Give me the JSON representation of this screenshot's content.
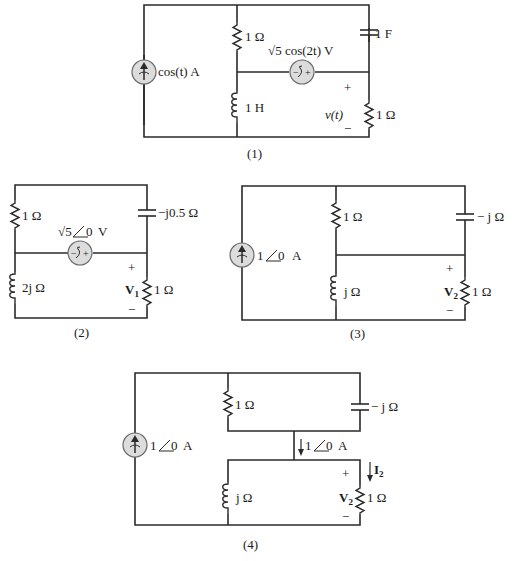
{
  "figure": {
    "circuits": [
      {
        "id": 1,
        "caption": "(1)",
        "current_source": "cos(t) A",
        "resistor_top": "1 Ω",
        "voltage_source": "√5 cos(2t) V",
        "capacitor": "1 F",
        "inductor": "1 H",
        "output_voltage": "v(t)",
        "resistor_load": "1 Ω",
        "plus": "+",
        "minus": "−"
      },
      {
        "id": 2,
        "caption": "(2)",
        "resistor_top": "1 Ω",
        "voltage_source": "√5 ∠0 V",
        "voltage_source_mag": "√5",
        "voltage_source_angle": "0",
        "voltage_source_unit": "V",
        "capacitor": "−j0.5 Ω",
        "inductor": "2j Ω",
        "output_voltage": "V",
        "output_voltage_sub": "1",
        "resistor_load": "1 Ω",
        "plus": "+",
        "minus": "−"
      },
      {
        "id": 3,
        "caption": "(3)",
        "current_source": "1 ∠0 A",
        "current_source_mag": "1",
        "current_source_angle": "0",
        "current_source_unit": "A",
        "resistor_top": "1 Ω",
        "capacitor": "− j Ω",
        "inductor": "j Ω",
        "output_voltage": "V",
        "output_voltage_sub": "2",
        "resistor_load": "1 Ω",
        "plus": "+",
        "minus": "−"
      },
      {
        "id": 4,
        "caption": "(4)",
        "current_source": "1 ∠0 A",
        "current_source_mag": "1",
        "current_source_angle": "0",
        "current_source_unit": "A",
        "resistor_top": "1 Ω",
        "capacitor": "− j Ω",
        "inductor": "j Ω",
        "branch_current": "1 ∠0 A",
        "branch_current_mag": "1",
        "branch_current_angle": "0",
        "branch_current_unit": "A",
        "load_current": "I",
        "load_current_sub": "2",
        "output_voltage": "V",
        "output_voltage_sub": "2",
        "resistor_load": "1 Ω",
        "plus": "+",
        "minus": "−"
      }
    ]
  }
}
